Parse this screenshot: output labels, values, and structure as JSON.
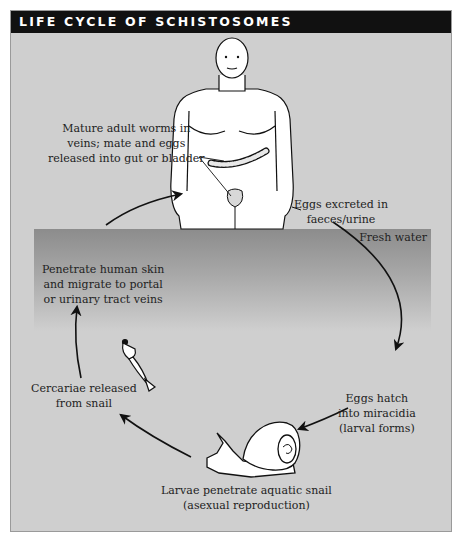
{
  "title": "LIFE CYCLE OF SCHISTOSOMES",
  "zones": {
    "water_label": "Fresh water"
  },
  "steps": [
    {
      "id": "adult",
      "lines": [
        "Mature adult worms in",
        "veins; mate and eggs",
        "released into gut or bladder"
      ]
    },
    {
      "id": "excretion",
      "lines": [
        "Eggs excreted in",
        "faeces/urine"
      ]
    },
    {
      "id": "hatch",
      "lines": [
        "Eggs hatch",
        "into miracidia",
        "(larval forms)"
      ]
    },
    {
      "id": "snail",
      "lines": [
        "Larvae penetrate aquatic snail",
        "(asexual reproduction)"
      ]
    },
    {
      "id": "cercariae",
      "lines": [
        "Cercariae released",
        "from snail"
      ]
    },
    {
      "id": "penetrate",
      "lines": [
        "Penetrate human skin",
        "and migrate to portal",
        "or urinary tract veins"
      ]
    }
  ],
  "illustrations": [
    "human-figure",
    "intestine",
    "bladder",
    "snail",
    "cercaria"
  ],
  "colors": {
    "title_bg": "#111111",
    "panel_bg": "#cfcfcf",
    "water_top": "#8c8c8c",
    "text": "#222222"
  }
}
